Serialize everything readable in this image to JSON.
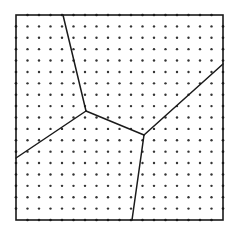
{
  "diagram": {
    "type": "voronoi-partition-on-dot-grid",
    "colors": {
      "background": "#ffffff",
      "line": "#1a1a1a",
      "dot": "#333333"
    },
    "frame": {
      "x0": 16,
      "y0": 15,
      "x1": 223,
      "y1": 220
    },
    "grid": {
      "count": 17,
      "dot_radius": 1.2
    },
    "junctions": [
      {
        "id": "A",
        "x": 86,
        "y": 111
      },
      {
        "id": "B",
        "x": 144,
        "y": 135
      }
    ],
    "edges": [
      {
        "from": [
          63,
          15
        ],
        "to": [
          86,
          111
        ]
      },
      {
        "from": [
          86,
          111
        ],
        "to": [
          16,
          158
        ]
      },
      {
        "from": [
          86,
          111
        ],
        "to": [
          144,
          135
        ]
      },
      {
        "from": [
          144,
          135
        ],
        "to": [
          223,
          64
        ]
      },
      {
        "from": [
          144,
          135
        ],
        "to": [
          132,
          220
        ]
      }
    ]
  }
}
